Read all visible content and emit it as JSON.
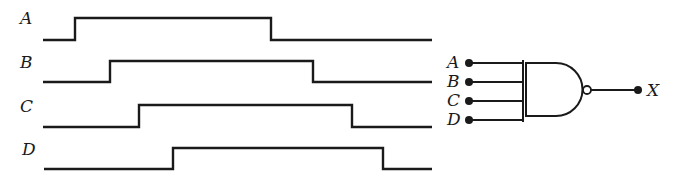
{
  "diagram": {
    "title": "",
    "type": "timing-diagram-with-nand-gate",
    "colors": {
      "ink": "#1a1a1a",
      "background": "#ffffff"
    },
    "waveforms": [
      {
        "label": "A",
        "rise_x": 75,
        "fall_x": 271
      },
      {
        "label": "B",
        "rise_x": 110,
        "fall_x": 313
      },
      {
        "label": "C",
        "rise_x": 139,
        "fall_x": 352
      },
      {
        "label": "D",
        "rise_x": 173,
        "fall_x": 383
      }
    ],
    "gate": {
      "type": "NAND",
      "inputs": [
        "A",
        "B",
        "C",
        "D"
      ],
      "output": "X"
    }
  }
}
